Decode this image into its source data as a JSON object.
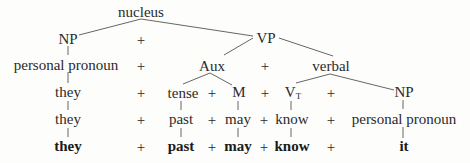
{
  "diagram": {
    "root": "nucleus",
    "row1": {
      "np": "NP",
      "plus": "+",
      "vp": "VP"
    },
    "row2": {
      "personal_pronoun": "personal pronoun",
      "plus1": "+",
      "aux": "Aux",
      "plus2": "+",
      "verbal": "verbal"
    },
    "row3": {
      "they": "they",
      "plus1": "+",
      "tense": "tense",
      "plus2": "+",
      "m": "M",
      "plus3": "+",
      "vt": "V",
      "vt_sub": "T",
      "plus4": "+",
      "np": "NP"
    },
    "row4": {
      "they": "they",
      "plus1": "+",
      "past": "past",
      "plus2": "+",
      "may": "may",
      "plus3": "+",
      "know": "know",
      "plus4": "+",
      "personal_pronoun": "personal pronoun"
    },
    "row5": {
      "they": "they",
      "plus1": "+",
      "past": "past",
      "plus2": "+",
      "may": "may",
      "plus3": "+",
      "know": "know",
      "plus4": "+",
      "it": "it"
    }
  },
  "colors": {
    "text": "#2a2a2a",
    "line": "#555555",
    "background": "#fdfdfb"
  }
}
